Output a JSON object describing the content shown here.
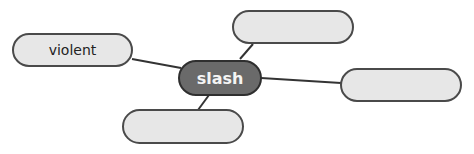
{
  "diagram": {
    "type": "word-web",
    "colors": {
      "center_fill": "#6a6a6a",
      "center_border": "#2f2f2f",
      "center_text": "#f4f4f4",
      "node_fill": "#e7e7e7",
      "node_border": "#4a4a4a",
      "node_text": "#222222",
      "link": "#333333"
    },
    "center": {
      "label": "slash"
    },
    "nodes": [
      {
        "id": "left",
        "label": "violent"
      },
      {
        "id": "top",
        "label": ""
      },
      {
        "id": "right",
        "label": ""
      },
      {
        "id": "bottom",
        "label": ""
      }
    ],
    "links": [
      {
        "from": "center",
        "to": "left"
      },
      {
        "from": "center",
        "to": "top"
      },
      {
        "from": "center",
        "to": "right"
      },
      {
        "from": "center",
        "to": "bottom"
      }
    ]
  }
}
